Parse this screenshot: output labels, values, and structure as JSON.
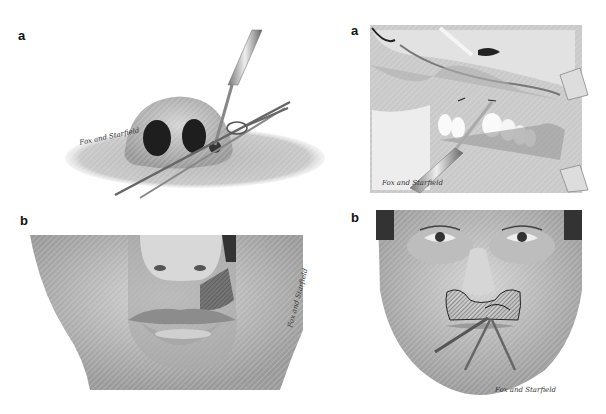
{
  "figure": {
    "panels": [
      {
        "id": "top-left",
        "label": "a",
        "subject": "nasal procedure with scalpel and forceps",
        "signature": "Fox and Starfield"
      },
      {
        "id": "top-right",
        "label": "a",
        "subject": "intraoral view with retracted lip and scalpel",
        "signature": "Fox and Starfield"
      },
      {
        "id": "bottom-left",
        "label": "b",
        "subject": "lower face with lip flap outline",
        "signature": "Fox and Starfield"
      },
      {
        "id": "bottom-right",
        "label": "b",
        "subject": "frontal face with hatched incision area and instruments",
        "signature": "Fox and Starfield"
      }
    ]
  }
}
